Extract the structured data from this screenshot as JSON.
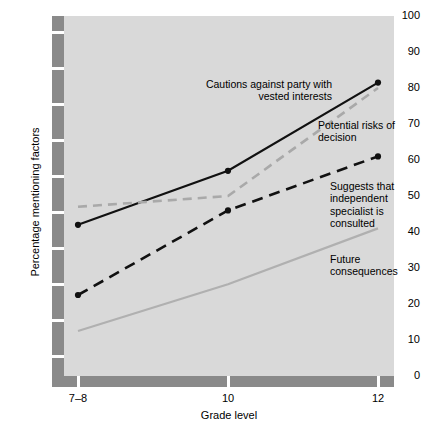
{
  "chart_data": {
    "type": "line",
    "title": "",
    "xlabel": "Grade level",
    "ylabel": "Percentage mentioning factors",
    "categories": [
      "7–8",
      "10",
      "12"
    ],
    "xtick_labels": [
      "7–8",
      "10",
      "12"
    ],
    "ytick_labels": [
      "0",
      "10",
      "20",
      "30",
      "40",
      "50",
      "60",
      "70",
      "80",
      "90",
      "100"
    ],
    "ylim": [
      0,
      100
    ],
    "ytick_step": 10,
    "grid": false,
    "legend_position": "inline-annotations",
    "series": [
      {
        "name": "Cautions against party with vested interests",
        "style": "solid",
        "color": "#111111",
        "markers": true,
        "values": [
          42,
          57,
          81.5
        ]
      },
      {
        "name": "Potential risks of decision",
        "style": "dashed",
        "color": "#a9a9a9",
        "markers": false,
        "values": [
          47,
          50,
          80
        ]
      },
      {
        "name": "Suggests that independent specialist is consulted",
        "style": "dashed",
        "color": "#111111",
        "markers": true,
        "values": [
          22.5,
          46,
          61
        ]
      },
      {
        "name": "Future consequences",
        "style": "solid",
        "color": "#b0b0b0",
        "markers": false,
        "values": [
          12.5,
          25.5,
          41
        ]
      }
    ],
    "annotations": [
      {
        "text": "Cautions against party with vested interests"
      },
      {
        "text": "Potential risks of decision"
      },
      {
        "text": "Suggests that independent specialist is consulted"
      },
      {
        "text": "Future consequences"
      }
    ],
    "colors": {
      "plot_background": "#d9d9d9",
      "axis_bar": "#8a8a8a",
      "page_background": "#ffffff"
    }
  }
}
